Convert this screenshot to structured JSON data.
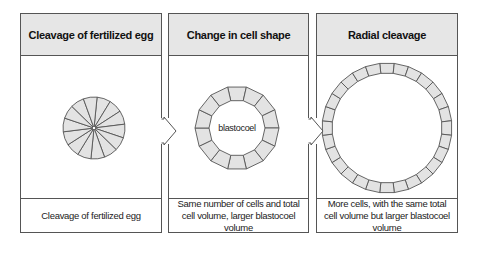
{
  "panels": [
    {
      "title": "Cleavage of fertilized egg",
      "caption": "Cleavage of fertilized egg",
      "figure": {
        "type": "segmented-disc",
        "segments": 14
      }
    },
    {
      "title": "Change in cell shape",
      "caption": "Same number of cells and total cell volume, larger blastocoel volume",
      "figure": {
        "type": "cell-ring",
        "cells": 14,
        "center_label": "blastocoel"
      }
    },
    {
      "title": "Radial cleavage",
      "caption": "More cells, with the same total cell volume but larger blastocoel volume",
      "figure": {
        "type": "cell-ring",
        "cells": 28
      }
    }
  ],
  "arrows": [
    {
      "from": "panel-1",
      "to": "panel-2",
      "icon": "chevron-right-arrow"
    },
    {
      "from": "panel-2",
      "to": "panel-3",
      "icon": "chevron-right-arrow"
    }
  ],
  "colors": {
    "header_fill": "#e6e6e6",
    "cell_fill": "#e3e3e3",
    "stroke": "#555555"
  }
}
